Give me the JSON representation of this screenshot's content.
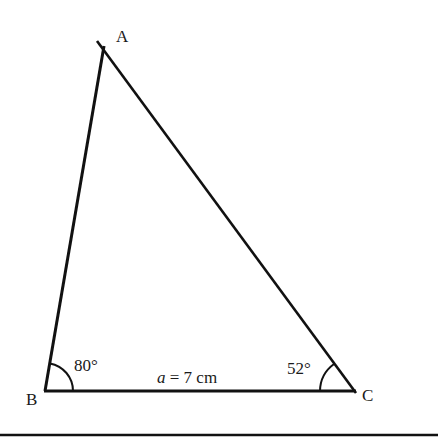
{
  "diagram": {
    "type": "triangle",
    "vertices": {
      "A": {
        "label": "A",
        "x": 103,
        "y": 50
      },
      "B": {
        "label": "B",
        "x": 45,
        "y": 391
      },
      "C": {
        "label": "C",
        "x": 354,
        "y": 391
      }
    },
    "angles": {
      "B": {
        "label": "80°",
        "value": 80
      },
      "C": {
        "label": "52°",
        "value": 52
      }
    },
    "sides": {
      "a": {
        "label": "a = 7 cm",
        "var": "a",
        "rest": " = 7 cm"
      }
    },
    "line_color": "#111111"
  }
}
